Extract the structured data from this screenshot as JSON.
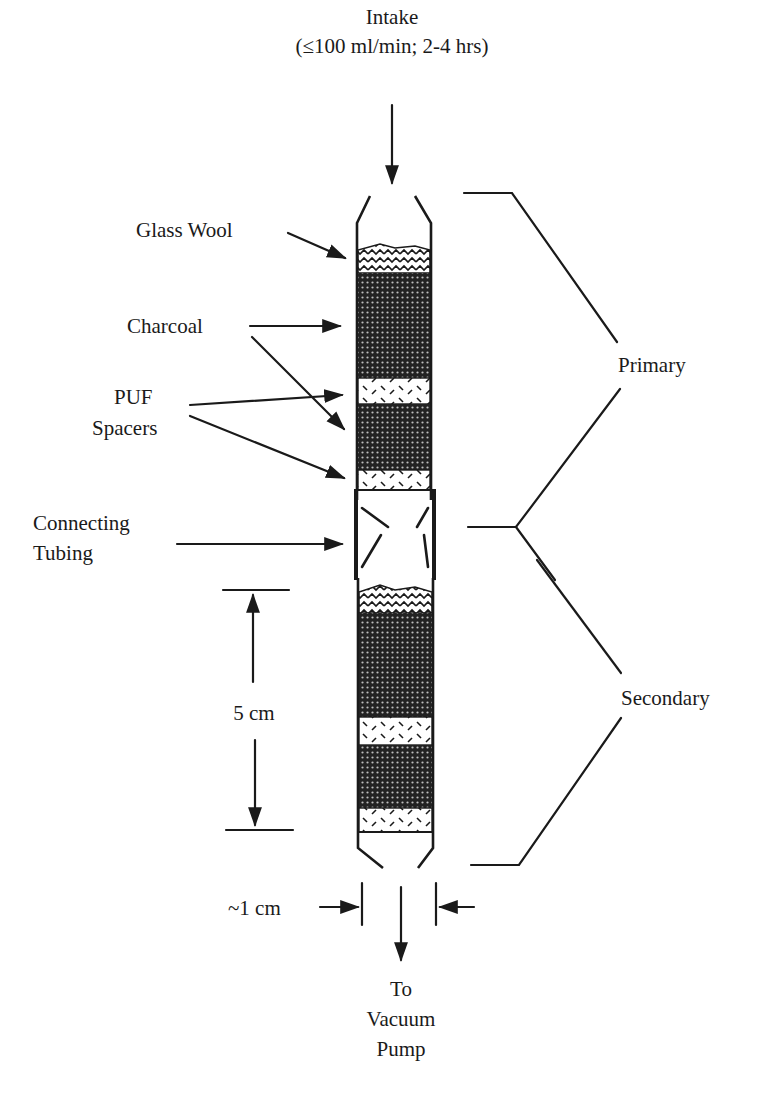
{
  "intake": {
    "label": "Intake",
    "sublabel": "(≤100 ml/min; 2-4 hrs)"
  },
  "components": {
    "glass_wool": "Glass Wool",
    "charcoal": "Charcoal",
    "puf_line1": "PUF",
    "puf_line2": "Spacers",
    "tubing_line1": "Connecting",
    "tubing_line2": "Tubing"
  },
  "sections": {
    "primary": "Primary",
    "secondary": "Secondary"
  },
  "dimensions": {
    "length": "5 cm",
    "diameter": "~1 cm"
  },
  "outlet": {
    "line1": "To",
    "line2": "Vacuum",
    "line3": "Pump"
  },
  "colors": {
    "ink": "#1a1a1a",
    "charcoal_fill": "#2b2b2b",
    "background": "#ffffff"
  }
}
